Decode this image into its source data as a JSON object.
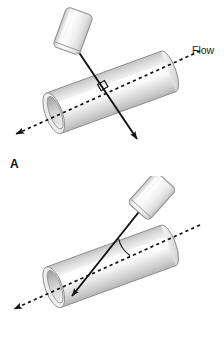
{
  "figure": {
    "background_color": "#ffffff",
    "width": 224,
    "height": 351
  },
  "colors": {
    "line": "#111111",
    "vessel_fill_light": "#f4f4f4",
    "vessel_fill_mid": "#d8d8d8",
    "vessel_fill_dark": "#b4b4b4",
    "vessel_stroke": "#8c8c8c",
    "vessel_highlight": "#ffffff",
    "probe_fill_light": "#fbfbfb",
    "probe_fill_mid": "#dcdcdc",
    "probe_stroke": "#9a9a9a",
    "text": "#111111"
  },
  "panels": [
    {
      "id": "A",
      "letter": "A",
      "flow_label": "Flow",
      "angle_marker": "right-angle-square",
      "angle_degrees": 90,
      "beam_passes_through": true,
      "probe_rotation_deg": 20,
      "vessel_rotation_deg": -20,
      "beam_direction": "perpendicular-to-flow",
      "flow_arrow_direction": "left-down"
    },
    {
      "id": "B",
      "letter": "B",
      "flow_label": "Flow",
      "angle_marker": "acute-angle-arc",
      "angle_degrees": 60,
      "beam_passes_through": false,
      "probe_rotation_deg": 42,
      "vessel_rotation_deg": -20,
      "beam_direction": "oblique-to-flow",
      "flow_arrow_direction": "left-down"
    }
  ],
  "elements": {
    "probe_name": "ultrasound-transducer",
    "vessel_name": "blood-vessel-cylinder",
    "beam_name": "ultrasound-beam-line",
    "flow_axis_name": "flow-axis-dashed-line"
  }
}
